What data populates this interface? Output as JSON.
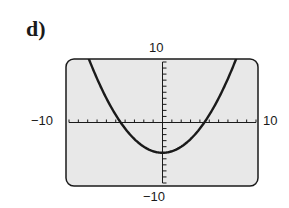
{
  "problem_label": "d)",
  "chart_data": {
    "type": "line",
    "title": "",
    "function": "y = x^2/4 - 5",
    "xlim": [
      -10,
      10
    ],
    "ylim": [
      -10,
      10
    ],
    "x_tick_step": 1,
    "y_tick_step": 1,
    "grid": false,
    "axis_labels": {
      "top": "10",
      "bottom": "-10",
      "left": "-10",
      "right": "10"
    },
    "vertex": [
      0,
      -5
    ],
    "x_intercepts": [
      -4.47,
      4.47
    ],
    "points": [
      [
        -8,
        11
      ],
      [
        -7.7,
        9.8
      ],
      [
        -6,
        4
      ],
      [
        -4.47,
        0
      ],
      [
        -4,
        -1
      ],
      [
        -2,
        -4
      ],
      [
        0,
        -5
      ],
      [
        2,
        -4
      ],
      [
        4,
        -1
      ],
      [
        4.47,
        0
      ],
      [
        6,
        4
      ],
      [
        7.7,
        9.8
      ]
    ],
    "colors": {
      "background": "#e8e8e8",
      "curve": "#1a1a1a",
      "frame": "#1a1a1a"
    }
  }
}
